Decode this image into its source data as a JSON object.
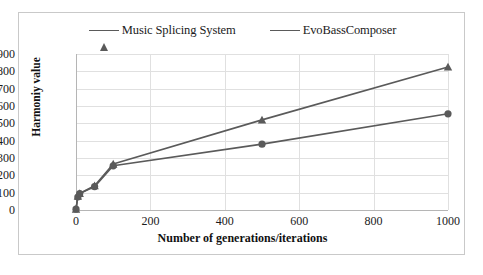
{
  "chart_data": {
    "type": "line",
    "title": "",
    "xlabel": "Number of generations/iterations",
    "ylabel": "Harmoniy value",
    "xlim": [
      0,
      1000
    ],
    "ylim": [
      0,
      900
    ],
    "xticks": [
      0,
      200,
      400,
      600,
      800,
      1000
    ],
    "yticks": [
      0,
      100,
      200,
      300,
      400,
      500,
      600,
      700,
      800,
      900
    ],
    "grid": true,
    "legend_position": "top-center",
    "series": [
      {
        "name": "Music Splicing System",
        "marker": "triangle",
        "color": "#5a5a5a",
        "x": [
          0,
          5,
          10,
          50,
          100,
          500,
          1000
        ],
        "values": [
          5,
          80,
          95,
          140,
          265,
          520,
          825
        ]
      },
      {
        "name": "EvoBassComposer",
        "marker": "circle",
        "color": "#5a5a5a",
        "x": [
          0,
          5,
          10,
          50,
          100,
          500,
          1000
        ],
        "values": [
          5,
          75,
          95,
          135,
          255,
          380,
          555
        ]
      }
    ]
  },
  "legend": {
    "entries": [
      {
        "label": "Music Splicing System",
        "marker": "triangle-marker"
      },
      {
        "label": "EvoBassComposer",
        "marker": "circle-marker"
      }
    ]
  },
  "axes": {
    "y_title": "Harmoniy value",
    "x_title": "Number of generations/iterations",
    "y_tick_labels": [
      "900",
      "800",
      "700",
      "600",
      "500",
      "400",
      "300",
      "200",
      "100",
      "0"
    ],
    "x_tick_labels": [
      "0",
      "200",
      "400",
      "600",
      "800",
      "1000"
    ]
  },
  "colors": {
    "series": "#5a5a5a",
    "grid": "#e0e0e0",
    "axis": "#b5b5b5",
    "border": "#c9c9c9",
    "text": "#1b1b1b"
  }
}
